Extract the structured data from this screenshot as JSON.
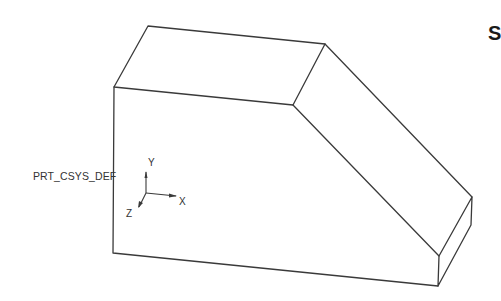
{
  "figure": {
    "csys": {
      "name": "PRT_CSYS_DEF",
      "axes": {
        "x": "X",
        "y": "Y",
        "z": "Z"
      }
    },
    "corner_text": "S"
  },
  "colors": {
    "line": "#3a3a3a",
    "text": "#333333",
    "background": "#ffffff"
  }
}
